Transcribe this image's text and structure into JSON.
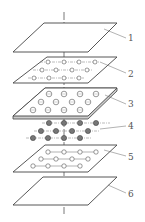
{
  "diagram": {
    "type": "exploded-layer-view",
    "colors": {
      "line": "#444444",
      "fill": "#ffffff",
      "dot_fill": "#777777",
      "label": "#555555"
    },
    "layers": [
      {
        "id": 1,
        "label": "1",
        "kind": "plain sheet"
      },
      {
        "id": 2,
        "label": "2",
        "kind": "sheet with small open circles on dash-dot grid"
      },
      {
        "id": 3,
        "label": "3",
        "kind": "thick plate with circular cells"
      },
      {
        "id": 4,
        "label": "4",
        "kind": "array of solid dots on dash-dot lines"
      },
      {
        "id": 5,
        "label": "5",
        "kind": "sheet with open circles connected by lines"
      },
      {
        "id": 6,
        "label": "6",
        "kind": "plain sheet"
      }
    ]
  }
}
